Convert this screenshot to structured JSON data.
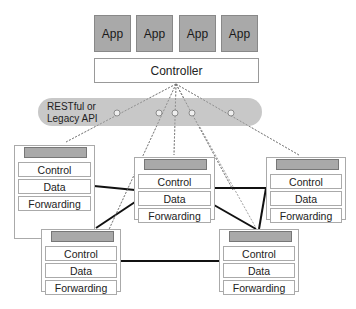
{
  "apps": [
    {
      "label": "App"
    },
    {
      "label": "App"
    },
    {
      "label": "App"
    },
    {
      "label": "App"
    }
  ],
  "controller": {
    "label": "Controller"
  },
  "api": {
    "label_line1": "RESTful or",
    "label_line2": "Legacy API"
  },
  "switches": [
    {
      "id": "top-left",
      "layers": [
        "Control",
        "Data",
        "Forwarding"
      ]
    },
    {
      "id": "center",
      "layers": [
        "Control",
        "Data",
        "Forwarding"
      ]
    },
    {
      "id": "right",
      "layers": [
        "Control",
        "Data",
        "Forwarding"
      ]
    },
    {
      "id": "bottom-left",
      "layers": [
        "Control",
        "Data",
        "Forwarding"
      ]
    },
    {
      "id": "bottom-right",
      "layers": [
        "Control",
        "Data",
        "Forwarding"
      ]
    }
  ],
  "colors": {
    "app_fill": "#a9a9a9",
    "api_fill": "#c8c8c8",
    "switch_header": "#a9a9a9",
    "link": "#111111"
  }
}
